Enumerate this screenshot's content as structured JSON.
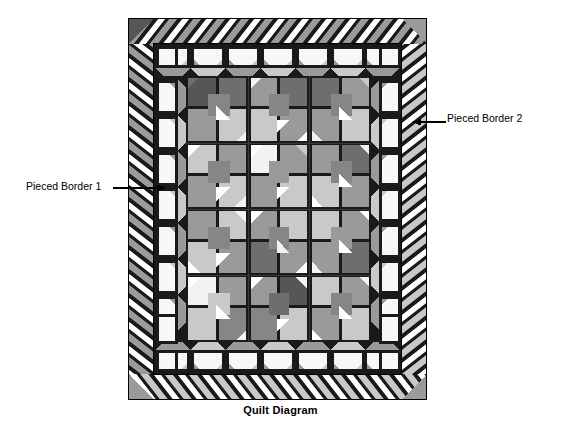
{
  "figure": {
    "caption": "Quilt Diagram",
    "annotations": [
      {
        "id": "pieced-border-1",
        "text": "Pieced Border 1",
        "points_to": "inner pieced border",
        "leader": "right"
      },
      {
        "id": "pieced-border-2",
        "text": "Pieced Border 2",
        "points_to": "outer pieced border",
        "leader": "left"
      }
    ]
  },
  "quilt": {
    "outline": {
      "x": 128,
      "y": 18,
      "width": 299,
      "height": 382
    },
    "structure": {
      "center_grid_columns": 3,
      "center_grid_rows": 4,
      "inner_border_name": "Pieced Border 1",
      "outer_border_name": "Pieced Border 2",
      "inner_border_width": 22,
      "outer_border_width": 26
    },
    "palette": {
      "black": "#1a1a1a",
      "white": "#ffffff",
      "off_white": "#f2f2f2",
      "light_gray": "#c9c9c9",
      "mid_gray": "#9a9a9a",
      "medium_gray": "#868686",
      "dark_gray": "#6e6e6e",
      "darkest_gray": "#565656",
      "outline": "#000000"
    },
    "fabrics": [
      {
        "name": "black",
        "hex": "#1a1a1a"
      },
      {
        "name": "white",
        "hex": "#ffffff"
      },
      {
        "name": "light gray",
        "hex": "#c9c9c9"
      },
      {
        "name": "medium gray",
        "hex": "#9a9a9a"
      },
      {
        "name": "dark gray",
        "hex": "#6e6e6e"
      },
      {
        "name": "darkest gray",
        "hex": "#565656"
      }
    ]
  }
}
